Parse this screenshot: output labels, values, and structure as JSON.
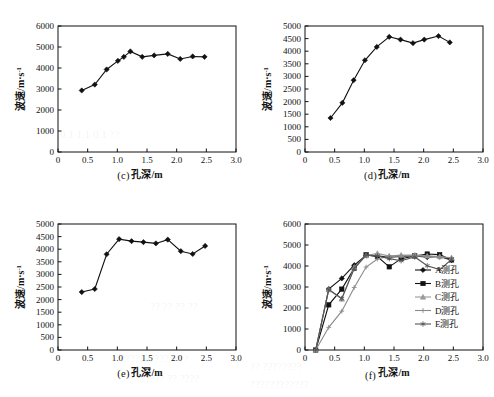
{
  "figure": {
    "background": "#ffffff",
    "ink": "#111111",
    "panels": [
      "c",
      "d",
      "e",
      "f"
    ]
  },
  "watermarks": [
    {
      "text": "0.1  1.1   0.1  ??",
      "x": 60,
      "y": 128
    },
    {
      "text": "?? ??   ??  ??",
      "x": 150,
      "y": 300
    },
    {
      "text": "??????????????",
      "x": 120,
      "y": 352
    },
    {
      "text": "????? ?? ????",
      "x": 140,
      "y": 372
    },
    {
      "text": "??  ????????",
      "x": 250,
      "y": 360
    },
    {
      "text": "????????????",
      "x": 250,
      "y": 378
    }
  ],
  "chart_data": [
    {
      "panel": "c",
      "caption": "(c)",
      "type": "line",
      "title": "",
      "xlabel": "孔深/m",
      "ylabel": "波速/m·s",
      "ylabel_sup": "-1",
      "xlim": [
        0,
        3.0
      ],
      "ylim": [
        0,
        6000
      ],
      "xticks": [
        0,
        0.5,
        1.0,
        1.5,
        2.0,
        2.5,
        3.0
      ],
      "xticklabels": [
        "0",
        "0.5",
        "1.0",
        "1.5",
        "2.0",
        "2.5",
        "3.0"
      ],
      "yticks": [
        0,
        1000,
        2000,
        3000,
        4000,
        5000,
        6000
      ],
      "yticklabels": [
        "0",
        "1000",
        "2000",
        "3000",
        "4000",
        "5000",
        "6000"
      ],
      "grid": false,
      "legend": null,
      "series": [
        {
          "name": "c-series",
          "marker": "diamond",
          "color": "#111111",
          "x": [
            0.4,
            0.62,
            0.82,
            1.01,
            1.11,
            1.22,
            1.42,
            1.62,
            1.85,
            2.06,
            2.27,
            2.47
          ],
          "y": [
            2930,
            3210,
            3930,
            4340,
            4530,
            4790,
            4530,
            4600,
            4670,
            4430,
            4550,
            4530
          ]
        }
      ]
    },
    {
      "panel": "d",
      "caption": "(d)",
      "type": "line",
      "title": "",
      "xlabel": "孔深/m",
      "ylabel": "波速/m·s",
      "ylabel_sup": "-1",
      "xlim": [
        0,
        3.0
      ],
      "ylim": [
        0,
        5000
      ],
      "xticks": [
        0,
        0.5,
        1.0,
        1.5,
        2.0,
        2.5,
        3.0
      ],
      "xticklabels": [
        "0",
        "0.5",
        "1.0",
        "1.5",
        "2.0",
        "2.5",
        "3.0"
      ],
      "yticks": [
        0,
        500,
        1000,
        1500,
        2000,
        2500,
        3000,
        3500,
        4000,
        4500,
        5000
      ],
      "yticklabels": [
        "0",
        "500",
        "1000",
        "1500",
        "2000",
        "2500",
        "3000",
        "3500",
        "4000",
        "4500",
        "5000"
      ],
      "grid": false,
      "legend": null,
      "series": [
        {
          "name": "d-series",
          "marker": "diamond",
          "color": "#111111",
          "x": [
            0.43,
            0.63,
            0.82,
            1.01,
            1.21,
            1.42,
            1.61,
            1.82,
            2.01,
            2.25,
            2.44
          ],
          "y": [
            1350,
            1950,
            2850,
            3640,
            4170,
            4570,
            4460,
            4320,
            4460,
            4600,
            4350
          ]
        }
      ]
    },
    {
      "panel": "e",
      "caption": "(e)",
      "type": "line",
      "title": "",
      "xlabel": "孔深/m",
      "ylabel": "波速/m·s",
      "ylabel_sup": "-1",
      "xlim": [
        0,
        3.0
      ],
      "ylim": [
        0,
        5000
      ],
      "xticks": [
        0,
        0.5,
        1.0,
        1.5,
        2.0,
        2.5,
        3.0
      ],
      "xticklabels": [
        "0",
        "0.5",
        "1.0",
        "1.5",
        "2.0",
        "2.5",
        "3.0"
      ],
      "yticks": [
        0,
        500,
        1000,
        1500,
        2000,
        2500,
        3000,
        3500,
        4000,
        4500,
        5000
      ],
      "yticklabels": [
        "0",
        "500",
        "1000",
        "1500",
        "2000",
        "2500",
        "3000",
        "3500",
        "4000",
        "4500",
        "5000"
      ],
      "grid": false,
      "legend": null,
      "series": [
        {
          "name": "e-series",
          "marker": "diamond",
          "color": "#111111",
          "x": [
            0.4,
            0.62,
            0.82,
            1.03,
            1.24,
            1.44,
            1.65,
            1.85,
            2.07,
            2.27,
            2.48
          ],
          "y": [
            2300,
            2420,
            3800,
            4400,
            4320,
            4280,
            4230,
            4380,
            3920,
            3810,
            4130
          ]
        }
      ]
    },
    {
      "panel": "f",
      "caption": "(f)",
      "type": "line",
      "title": "",
      "xlabel": "孔深/m",
      "ylabel": "波速/m·s",
      "ylabel_sup": "-1",
      "xlim": [
        0,
        3.0
      ],
      "ylim": [
        0,
        6000
      ],
      "xticks": [
        0,
        0.5,
        1.0,
        1.5,
        2.0,
        2.5,
        3.0
      ],
      "xticklabels": [
        "0",
        "0.5",
        "1.0",
        "1.5",
        "2.0",
        "2.5",
        "3.0"
      ],
      "yticks": [
        0,
        1000,
        2000,
        3000,
        4000,
        5000,
        6000
      ],
      "yticklabels": [
        "0",
        "1000",
        "2000",
        "3000",
        "4000",
        "5000",
        "6000"
      ],
      "grid": false,
      "legend": {
        "position": "inside-right",
        "entries": [
          {
            "label": "A测孔",
            "marker": "diamond",
            "color": "#111111"
          },
          {
            "label": "B测孔",
            "marker": "square",
            "color": "#111111"
          },
          {
            "label": "C测孔",
            "marker": "triangle",
            "color": "#9a9a9a"
          },
          {
            "label": "D测孔",
            "marker": "plus",
            "color": "#8a8a8a"
          },
          {
            "label": "E测孔",
            "marker": "asterisk",
            "color": "#555555"
          }
        ]
      },
      "series": [
        {
          "name": "A测孔",
          "marker": "diamond",
          "color": "#111111",
          "x": [
            0.18,
            0.4,
            0.62,
            0.83,
            1.03,
            1.22,
            1.42,
            1.62,
            1.85,
            2.06,
            2.27,
            2.47
          ],
          "y": [
            0,
            2900,
            3410,
            4040,
            4510,
            4480,
            4420,
            4450,
            4480,
            4420,
            4450,
            4280
          ]
        },
        {
          "name": "B测孔",
          "marker": "square",
          "color": "#111111",
          "x": [
            0.18,
            0.4,
            0.62,
            0.83,
            1.03,
            1.22,
            1.42,
            1.62,
            1.85,
            2.06,
            2.27,
            2.47
          ],
          "y": [
            0,
            2150,
            2900,
            3900,
            4530,
            4450,
            3960,
            4350,
            4480,
            4570,
            4540,
            4290
          ]
        },
        {
          "name": "C测孔",
          "marker": "triangle",
          "color": "#9a9a9a",
          "x": [
            0.18,
            0.4,
            0.62,
            0.83,
            1.03,
            1.22,
            1.42,
            1.62,
            1.85,
            2.06,
            2.27,
            2.47
          ],
          "y": [
            0,
            2870,
            2430,
            3940,
            4490,
            4600,
            4470,
            4520,
            4520,
            4480,
            4450,
            4390
          ]
        },
        {
          "name": "D测孔",
          "marker": "plus",
          "color": "#8a8a8a",
          "x": [
            0.18,
            0.4,
            0.62,
            0.83,
            1.03,
            1.22,
            1.42,
            1.62,
            1.85,
            2.06,
            2.27,
            2.47
          ],
          "y": [
            0,
            1080,
            1850,
            2980,
            3950,
            4330,
            4470,
            4480,
            4480,
            4470,
            4420,
            4380
          ]
        },
        {
          "name": "E测孔",
          "marker": "asterisk",
          "color": "#555555",
          "x": [
            0.18,
            0.4,
            0.62,
            0.83,
            1.03,
            1.22,
            1.42,
            1.62,
            1.85,
            2.06,
            2.27,
            2.47
          ],
          "y": [
            0,
            2880,
            2450,
            3880,
            4520,
            4480,
            4350,
            4250,
            4430,
            4010,
            3830,
            4310
          ]
        }
      ]
    }
  ]
}
